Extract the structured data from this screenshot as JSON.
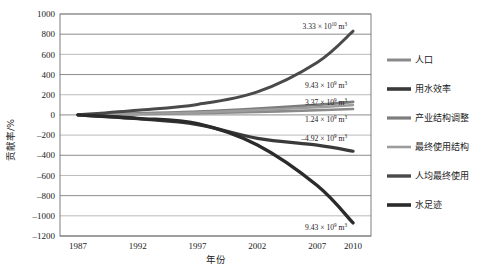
{
  "figure": {
    "background": "#ffffff",
    "frame_color": "#6f6f6f"
  },
  "chart_data": {
    "type": "line",
    "title": "",
    "subtitle": "",
    "xlabel": "年份",
    "ylabel": "贡献率/%",
    "x": [
      1987,
      1992,
      1997,
      2002,
      2007,
      2010
    ],
    "xticks": [
      "1987",
      "1992",
      "1997",
      "2002",
      "2007",
      "2010"
    ],
    "yticks": [
      "1000",
      "800",
      "600",
      "400",
      "200",
      "0",
      "-200",
      "-400",
      "-600",
      "-800",
      "-1000",
      "-1200"
    ],
    "ylim": [
      -1200,
      1000
    ],
    "xlim": [
      1985.5,
      2011.5
    ],
    "grid": true,
    "grid_axis": "y",
    "legend_position": "right",
    "series": [
      {
        "name": "人口",
        "color": "#8a8a8a",
        "width": 2.6,
        "values": [
          0,
          8,
          18,
          30,
          46,
          58
        ]
      },
      {
        "name": "用水效率",
        "color": "#3a3a3a",
        "width": 3.2,
        "values": [
          0,
          -38,
          -96,
          -232,
          -300,
          -360
        ]
      },
      {
        "name": "产业结构调整",
        "color": "#7c7c7c",
        "width": 2.8,
        "values": [
          0,
          14,
          32,
          62,
          100,
          130
        ]
      },
      {
        "name": "最终使用结构",
        "color": "#9d9d9d",
        "width": 2.4,
        "values": [
          0,
          10,
          24,
          48,
          76,
          98
        ]
      },
      {
        "name": "人均最终使用",
        "color": "#4a4a4a",
        "width": 3.0,
        "values": [
          0,
          46,
          104,
          228,
          520,
          830
        ]
      },
      {
        "name": "水足迹",
        "color": "#2b2b2b",
        "width": 3.4,
        "values": [
          0,
          -34,
          -86,
          -298,
          -700,
          -1070
        ]
      }
    ],
    "annotations": [
      {
        "id": "annot-population-total",
        "text": "3.33 × 10^10 m^3",
        "mantissa": "3.33 × 10",
        "exponent": "10",
        "unit": "m",
        "unit_exponent": "3",
        "x": 2010,
        "y": 880
      },
      {
        "id": "annot-water-efficiency",
        "text": "9.43 × 10^9 m^3",
        "mantissa": "9.43 × 10",
        "exponent": "9",
        "unit": "m",
        "unit_exponent": "3",
        "x": 2010,
        "y": 300
      },
      {
        "id": "annot-industry-structure",
        "text": "3.37 × 10^9 m^3",
        "mantissa": "3.37 × 10",
        "exponent": "9",
        "unit": "m",
        "unit_exponent": "3",
        "x": 2010,
        "y": 130
      },
      {
        "id": "annot-final-use-structure",
        "text": "1.24 × 10^9 m^3",
        "mantissa": "1.24 × 10",
        "exponent": "9",
        "unit": "m",
        "unit_exponent": "3",
        "x": 2010,
        "y": -40
      },
      {
        "id": "annot-per-capita-final-use",
        "text": "-4.92 × 10^9 m^3",
        "mantissa": "–4.92 × 10",
        "exponent": "9",
        "unit": "m",
        "unit_exponent": "3",
        "x": 2010,
        "y": -230
      },
      {
        "id": "annot-water-footprint",
        "text": "9.43 × 10^9 m^3",
        "mantissa": "9.43 × 10",
        "exponent": "9",
        "unit": "m",
        "unit_exponent": "3",
        "x": 2010,
        "y": -1110
      }
    ]
  },
  "legend": {
    "items": [
      {
        "label": "人口",
        "color": "#8a8a8a",
        "width": 3.0
      },
      {
        "label": "用水效率",
        "color": "#3a3a3a",
        "width": 3.6
      },
      {
        "label": "产业结构调整",
        "color": "#7c7c7c",
        "width": 3.2
      },
      {
        "label": "最终使用结构",
        "color": "#9d9d9d",
        "width": 2.6
      },
      {
        "label": "人均最终使用",
        "color": "#4a4a4a",
        "width": 3.4
      },
      {
        "label": "水足迹",
        "color": "#2b2b2b",
        "width": 3.6
      }
    ]
  }
}
